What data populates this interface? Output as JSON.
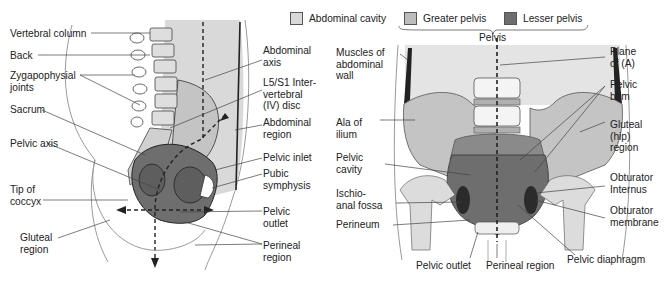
{
  "legend": {
    "items": [
      {
        "label": "Abdominal cavity",
        "color": "#d9d9d9"
      },
      {
        "label": "Greater pelvis",
        "color": "#bdbdbd"
      },
      {
        "label": "Lesser pelvis",
        "color": "#6e6e6e"
      }
    ],
    "group_label": "Pelvis"
  },
  "left_figure": {
    "labels_left": [
      "Vertebral column",
      "Back",
      "Zygapophysial\njoints",
      "Sacrum",
      "Pelvic axis",
      "Tip of\ncoccyx",
      "Gluteal\nregion"
    ],
    "labels_right": [
      "Abdominal\naxis",
      "L5/S1 Inter-\nvertebral\n(IV) disc",
      "Abdominal\nregion",
      "Pelvic inlet",
      "Pubic\nsymphysis",
      "Pelvic\noutlet",
      "Perineal\nregion"
    ]
  },
  "right_figure": {
    "labels_left": [
      "Muscles of\nabdominal\nwall",
      "Ala of\nilium",
      "Pelvic\ncavity",
      "Ischio-\nanal fossa",
      "Perineum"
    ],
    "labels_right": [
      "Plane\nof (A)",
      "Pelvic\nbrim",
      "Gluteal\n(hip)\nregion",
      "Obturator\nInternus",
      "Obturator\nmembrane"
    ],
    "labels_bottom": [
      "Pelvic outlet",
      "Perineal region",
      "Pelvic diaphragm"
    ]
  },
  "colors": {
    "abdominal_cavity": "#d9d9d9",
    "greater_pelvis": "#bdbdbd",
    "lesser_pelvis": "#6e6e6e",
    "bone": "#e8e8e8",
    "line": "#333333"
  }
}
